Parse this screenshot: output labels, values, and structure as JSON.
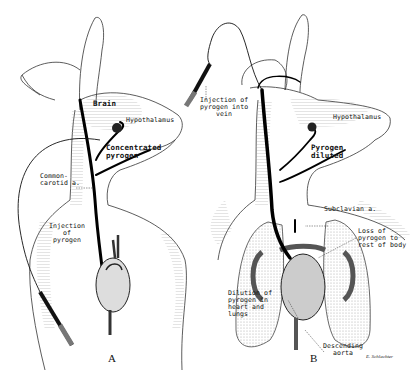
{
  "figure": {
    "panels": [
      {
        "id": "A",
        "label": "A",
        "labels": {
          "brain": "Brain",
          "hypothalamus": "Hypothalamus",
          "concentrated_pyrogen": "Concentrated\npyrogen",
          "common_carotid": "Common-\ncarotid a.",
          "injection": "Injection\nof\npyrogen"
        }
      },
      {
        "id": "B",
        "label": "B",
        "labels": {
          "injection_vein": "Injection of\npyrogen into\nvein",
          "hypothalamus": "Hypothalamus",
          "pyrogen_diluted": "Pyrogen\ndiluted",
          "subclavian": "Subclavian a.",
          "loss_of_pyrogen": "Loss of\npyrogen to\nrest of body",
          "dilution": "Dilution of\npyrogen in\nheart and\nlungs",
          "descending_aorta": "Descending\naorta"
        }
      }
    ],
    "signature": "E. Schlachter",
    "colors": {
      "ink": "#111111",
      "shade": "#bdbdbd",
      "background": "#ffffff"
    }
  }
}
